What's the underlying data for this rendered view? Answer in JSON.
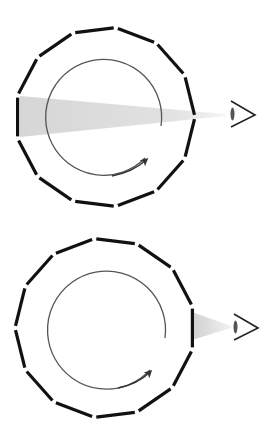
{
  "diagram": {
    "description": "Two panels: a segmented 13-gon ring with inner rotating circle arrow; an eye views through a gap. Top panel: wide shaded beam crossing the ring. Bottom panel: narrow beam only to outer ring.",
    "colors": {
      "background": "#ffffff",
      "segment": "#111111",
      "inner_circle": "#555555",
      "beam": "#d9d9d9",
      "eye": "#222222"
    },
    "panels": [
      {
        "id": "top",
        "center": [
          105,
          117
        ],
        "polygon_radius": 90,
        "sides": 13,
        "inner_radius": 58,
        "beam": "wide",
        "eye_position": [
          238,
          115
        ]
      },
      {
        "id": "bottom",
        "center": [
          105,
          328
        ],
        "polygon_radius": 90,
        "sides": 13,
        "inner_radius": 59,
        "beam": "narrow",
        "eye_position": [
          240,
          327
        ]
      }
    ],
    "icons": [
      "eye-icon",
      "rotation-arrow-icon"
    ]
  }
}
